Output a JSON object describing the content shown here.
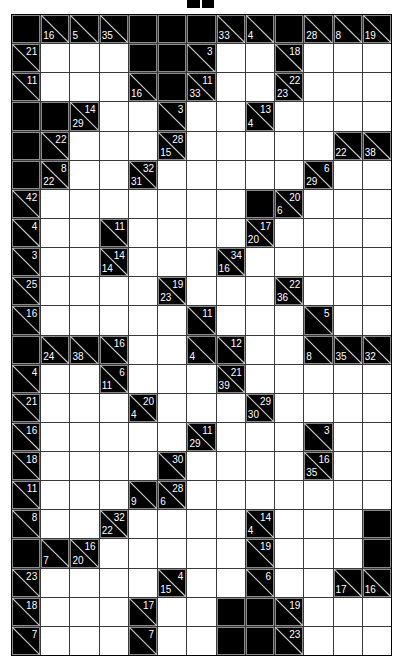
{
  "puzzle": {
    "type": "kakuro",
    "columns": 13,
    "rows": 22,
    "legend": "B = black block, W = white entry cell, otherwise clue cell with optional down (d) / across (r) sums",
    "grid": [
      [
        "B",
        {
          "d": 16
        },
        {
          "d": 5
        },
        {
          "d": 35
        },
        "B",
        "B",
        "B",
        {
          "d": 33
        },
        {
          "d": 4
        },
        "B",
        {
          "d": 28
        },
        {
          "d": 8
        },
        {
          "d": 19
        }
      ],
      [
        {
          "r": 21
        },
        "W",
        "W",
        "W",
        "B",
        "B",
        {
          "r": 3
        },
        "W",
        "W",
        {
          "r": 18
        },
        "W",
        "W",
        "W"
      ],
      [
        {
          "r": 11
        },
        "W",
        "W",
        "W",
        {
          "d": 16
        },
        "B",
        {
          "d": 33,
          "r": 11
        },
        "W",
        "W",
        {
          "d": 23,
          "r": 22
        },
        "W",
        "W",
        "W"
      ],
      [
        "B",
        "B",
        {
          "d": 29,
          "r": 14
        },
        "W",
        "W",
        {
          "r": 3
        },
        "W",
        "W",
        {
          "d": 4,
          "r": 13
        },
        "W",
        "W",
        "W",
        "W"
      ],
      [
        "B",
        {
          "r": 22
        },
        "W",
        "W",
        "W",
        {
          "d": 15,
          "r": 28
        },
        "W",
        "W",
        "W",
        "W",
        "W",
        {
          "d": 22
        },
        {
          "d": 38
        }
      ],
      [
        "B",
        {
          "d": 22,
          "r": 8
        },
        "W",
        "W",
        {
          "d": 31,
          "r": 32
        },
        "W",
        "W",
        "W",
        "W",
        "W",
        {
          "d": 29,
          "r": 6
        },
        "W",
        "W"
      ],
      [
        {
          "r": 42
        },
        "W",
        "W",
        "W",
        "W",
        "W",
        "W",
        "W",
        "B",
        {
          "d": 6,
          "r": 20
        },
        "W",
        "W",
        "W"
      ],
      [
        {
          "r": 4
        },
        "W",
        "W",
        {
          "r": 11
        },
        "W",
        "W",
        "W",
        "W",
        {
          "d": 20,
          "r": 17
        },
        "W",
        "W",
        "W",
        "W"
      ],
      [
        {
          "r": 3
        },
        "W",
        "W",
        {
          "d": 14,
          "r": 14
        },
        "W",
        "W",
        "W",
        {
          "d": 16,
          "r": 34
        },
        "W",
        "W",
        "W",
        "W",
        "W"
      ],
      [
        {
          "r": 25
        },
        "W",
        "W",
        "W",
        "W",
        {
          "d": 23,
          "r": 19
        },
        "W",
        "W",
        "W",
        {
          "d": 36,
          "r": 22
        },
        "W",
        "W",
        "W"
      ],
      [
        {
          "r": 16
        },
        "W",
        "W",
        "W",
        "W",
        "W",
        {
          "r": 11
        },
        "W",
        "W",
        "W",
        {
          "r": 5
        },
        "W",
        "W"
      ],
      [
        "B",
        {
          "d": 24
        },
        {
          "d": 38
        },
        {
          "r": 16
        },
        "W",
        "W",
        {
          "d": 4
        },
        {
          "r": 12
        },
        "W",
        "W",
        {
          "d": 8
        },
        {
          "d": 35
        },
        {
          "d": 32
        }
      ],
      [
        {
          "r": 4
        },
        "W",
        "W",
        {
          "d": 11,
          "r": 6
        },
        "W",
        "W",
        "W",
        {
          "d": 39,
          "r": 21
        },
        "W",
        "W",
        "W",
        "W",
        "W"
      ],
      [
        {
          "r": 21
        },
        "W",
        "W",
        "W",
        {
          "d": 4,
          "r": 20
        },
        "W",
        "W",
        "W",
        {
          "d": 30,
          "r": 29
        },
        "W",
        "W",
        "W",
        "W"
      ],
      [
        {
          "r": 16
        },
        "W",
        "W",
        "W",
        "W",
        "W",
        {
          "d": 29,
          "r": 11
        },
        "W",
        "W",
        "W",
        {
          "r": 3
        },
        "W",
        "W"
      ],
      [
        {
          "r": 18
        },
        "W",
        "W",
        "W",
        "W",
        {
          "r": 30
        },
        "W",
        "W",
        "W",
        "W",
        {
          "d": 35,
          "r": 16
        },
        "W",
        "W"
      ],
      [
        {
          "r": 11
        },
        "W",
        "W",
        "W",
        {
          "d": 9
        },
        {
          "d": 6,
          "r": 28
        },
        "W",
        "W",
        "W",
        "W",
        "W",
        "W",
        "W"
      ],
      [
        {
          "r": 8
        },
        "W",
        "W",
        {
          "d": 22,
          "r": 32
        },
        "W",
        "W",
        "W",
        "W",
        {
          "d": 4,
          "r": 14
        },
        "W",
        "W",
        "W",
        "B"
      ],
      [
        "B",
        {
          "d": 7
        },
        {
          "d": 20,
          "r": 16
        },
        "W",
        "W",
        "W",
        "W",
        "W",
        {
          "r": 19
        },
        "W",
        "W",
        "W",
        "B"
      ],
      [
        {
          "r": 23
        },
        "W",
        "W",
        "W",
        "W",
        {
          "d": 15,
          "r": 4
        },
        "W",
        "W",
        {
          "r": 6
        },
        "W",
        "W",
        {
          "d": 17
        },
        {
          "d": 16
        }
      ],
      [
        {
          "r": 18
        },
        "W",
        "W",
        "W",
        {
          "r": 17
        },
        "W",
        "W",
        "B",
        "B",
        {
          "r": 19
        },
        "W",
        "W",
        "W"
      ],
      [
        {
          "r": 7
        },
        "W",
        "W",
        "W",
        {
          "r": 7
        },
        "W",
        "W",
        "B",
        "B",
        {
          "r": 23
        },
        "W",
        "W",
        "W"
      ]
    ]
  },
  "colors": {
    "block": "#000000",
    "entry": "#ffffff",
    "clue_text": "#ffffff",
    "clue_border": "#8a8a8a",
    "grid_line": "#3a3a3a"
  }
}
